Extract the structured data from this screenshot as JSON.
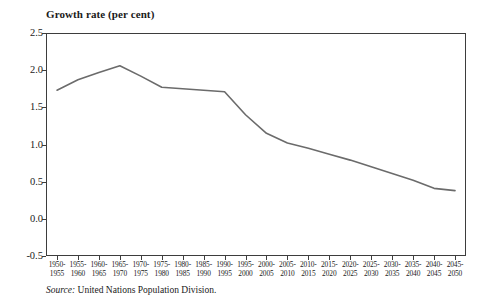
{
  "chart_data": {
    "type": "line",
    "title": "Growth rate (per cent)",
    "xlabel": "",
    "ylabel": "",
    "ylim": [
      -0.5,
      2.5
    ],
    "ytick_values": [
      2.5,
      2.0,
      1.5,
      1.0,
      0.5,
      0.0,
      -0.5
    ],
    "ytick_labels": [
      "2.5",
      "2.0",
      "1.5",
      "1.0",
      "0.5",
      "0.0",
      "-0.5"
    ],
    "grid": false,
    "legend": "none",
    "line_color": "#6b6b6b",
    "categories": [
      "1950-1955",
      "1955-1960",
      "1960-1965",
      "1965-1970",
      "1970-1975",
      "1975-1980",
      "1980-1985",
      "1985-1990",
      "1990-1995",
      "1995-2000",
      "2000-2005",
      "2005-2010",
      "2010-2015",
      "2015-2020",
      "2020-2025",
      "2025-2030",
      "2030-2035",
      "2035-2040",
      "2040-2045",
      "2045-2050"
    ],
    "categories_top": [
      "1950-",
      "1955-",
      "1960-",
      "1965-",
      "1970-",
      "1975-",
      "1980-",
      "1985-",
      "1990-",
      "1995-",
      "2000-",
      "2005-",
      "2010-",
      "2015-",
      "2020-",
      "2025-",
      "2030-",
      "2035-",
      "2040-",
      "2045-"
    ],
    "categories_bottom": [
      "1955",
      "1960",
      "1965",
      "1970",
      "1975",
      "1980",
      "1985",
      "1990",
      "1995",
      "2000",
      "2005",
      "2010",
      "2015",
      "2020",
      "2025",
      "2030",
      "2035",
      "2040",
      "2045",
      "2050"
    ],
    "values": [
      1.73,
      1.87,
      1.97,
      2.06,
      1.92,
      1.77,
      1.75,
      1.73,
      1.71,
      1.4,
      1.15,
      1.02,
      0.95,
      0.87,
      0.79,
      0.7,
      0.61,
      0.52,
      0.41,
      0.38
    ]
  },
  "source": {
    "label": "Source:",
    "text": "United Nations Population Division."
  }
}
